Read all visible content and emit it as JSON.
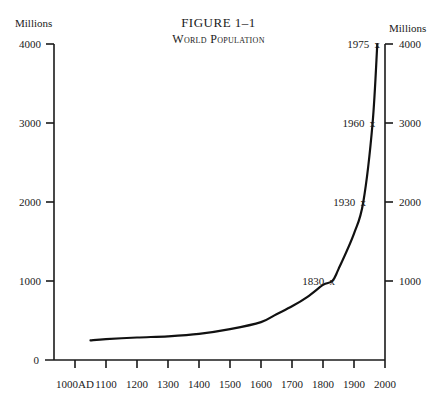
{
  "figure": {
    "number_label": "FIGURE 1–1",
    "title": "World Population"
  },
  "axes": {
    "left_unit": "Millions",
    "right_unit": "Millions"
  },
  "chart_data": {
    "type": "line",
    "xlabel": "",
    "ylabel": "Millions",
    "ylabel_right": "Millions",
    "x_ticks": [
      "1000AD",
      "1100",
      "1200",
      "1300",
      "1400",
      "1500",
      "1600",
      "1700",
      "1800",
      "1900",
      "2000"
    ],
    "y_ticks": [
      0,
      1000,
      2000,
      3000,
      4000
    ],
    "y_ticks_right": [
      1000,
      2000,
      3000,
      4000
    ],
    "xlim": [
      1000,
      2000
    ],
    "ylim": [
      0,
      4000
    ],
    "grid": false,
    "legend": null,
    "series": [
      {
        "name": "World Population",
        "x": [
          1050,
          1100,
          1200,
          1300,
          1400,
          1500,
          1600,
          1650,
          1700,
          1750,
          1800,
          1830,
          1850,
          1900,
          1930,
          1960,
          1975
        ],
        "y": [
          250,
          265,
          285,
          300,
          330,
          390,
          480,
          580,
          680,
          800,
          950,
          1000,
          1150,
          1600,
          2000,
          3000,
          4000
        ]
      }
    ],
    "annotations": [
      {
        "label": "1830",
        "x": 1830,
        "y": 1000,
        "marker": "x"
      },
      {
        "label": "1930",
        "x": 1930,
        "y": 2000,
        "marker": "x"
      },
      {
        "label": "1960",
        "x": 1960,
        "y": 3000,
        "marker": "x"
      },
      {
        "label": "1975",
        "x": 1975,
        "y": 4000,
        "marker": "x"
      }
    ]
  }
}
